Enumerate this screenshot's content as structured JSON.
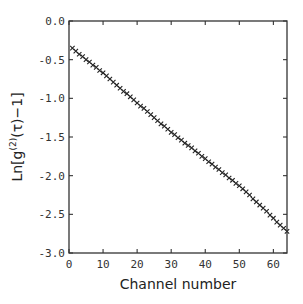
{
  "chart_data": {
    "type": "scatter",
    "title": "",
    "xlabel": "Channel number",
    "ylabel": "Ln[g(2)(τ)−1]",
    "ylabel_parts": {
      "prefix": "Ln[g",
      "superscript": "(2)",
      "suffix": "(τ)−1]"
    },
    "xlim": [
      0,
      64
    ],
    "ylim": [
      -3.0,
      0.0
    ],
    "xticks": [
      0,
      10,
      20,
      30,
      40,
      50,
      60
    ],
    "xtick_labels": [
      "0",
      "10",
      "20",
      "30",
      "40",
      "50",
      "60"
    ],
    "yticks": [
      0.0,
      -0.5,
      -1.0,
      -1.5,
      -2.0,
      -2.5,
      -3.0
    ],
    "ytick_labels": [
      "0.0",
      "-0.5",
      "-1.0",
      "-1.5",
      "-2.0",
      "-2.5",
      "-3.0"
    ],
    "grid": false,
    "legend": null,
    "marker": "x",
    "series": [
      {
        "name": "Ln[g(2)(τ)-1]",
        "x": [
          1,
          2,
          3,
          4,
          5,
          6,
          7,
          8,
          9,
          10,
          11,
          12,
          13,
          14,
          15,
          16,
          17,
          18,
          19,
          20,
          21,
          22,
          23,
          24,
          25,
          26,
          27,
          28,
          29,
          30,
          31,
          32,
          33,
          34,
          35,
          36,
          37,
          38,
          39,
          40,
          41,
          42,
          43,
          44,
          45,
          46,
          47,
          48,
          49,
          50,
          51,
          52,
          53,
          54,
          55,
          56,
          57,
          58,
          59,
          60,
          61,
          62,
          63,
          64
        ],
        "values": [
          -0.35,
          -0.39,
          -0.43,
          -0.46,
          -0.5,
          -0.53,
          -0.57,
          -0.6,
          -0.64,
          -0.67,
          -0.71,
          -0.75,
          -0.79,
          -0.83,
          -0.87,
          -0.91,
          -0.94,
          -0.98,
          -1.02,
          -1.06,
          -1.1,
          -1.13,
          -1.17,
          -1.21,
          -1.25,
          -1.29,
          -1.33,
          -1.36,
          -1.4,
          -1.44,
          -1.47,
          -1.51,
          -1.54,
          -1.58,
          -1.61,
          -1.64,
          -1.68,
          -1.71,
          -1.75,
          -1.78,
          -1.82,
          -1.85,
          -1.89,
          -1.92,
          -1.96,
          -1.99,
          -2.03,
          -2.06,
          -2.1,
          -2.13,
          -2.17,
          -2.21,
          -2.25,
          -2.3,
          -2.34,
          -2.38,
          -2.42,
          -2.46,
          -2.51,
          -2.55,
          -2.6,
          -2.64,
          -2.68,
          -2.72
        ]
      }
    ]
  }
}
